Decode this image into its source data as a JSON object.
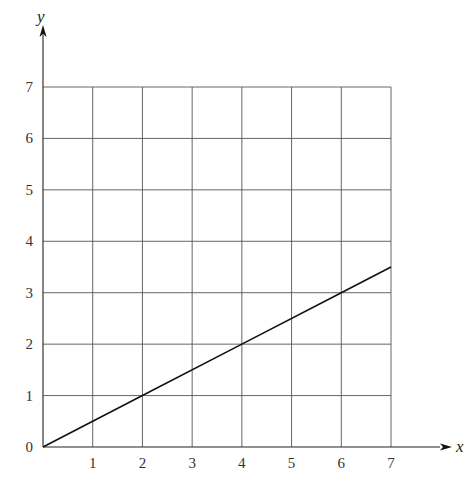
{
  "chart_data": {
    "type": "line",
    "title": "",
    "xlabel": "x",
    "ylabel": "y",
    "xlim": [
      0,
      7
    ],
    "ylim": [
      0,
      7
    ],
    "grid": true,
    "x_ticks": [
      "1",
      "2",
      "3",
      "4",
      "5",
      "6",
      "7"
    ],
    "y_ticks": [
      "0",
      "1",
      "2",
      "3",
      "4",
      "5",
      "6",
      "7"
    ],
    "series": [
      {
        "name": "line",
        "x": [
          0,
          2,
          4,
          6,
          7
        ],
        "y": [
          0,
          1,
          2,
          3,
          3.5
        ]
      }
    ],
    "legend": null
  }
}
